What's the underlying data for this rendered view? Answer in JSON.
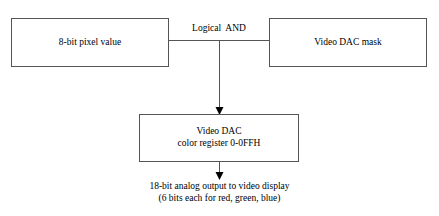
{
  "diagram": {
    "background_color": "#ffffff",
    "line_color": "#555555",
    "text_color": "#000000",
    "boxes": {
      "pixel_value": {
        "label": "8-bit pixel value"
      },
      "dac_mask": {
        "label": "Video DAC mask"
      },
      "video_dac": {
        "line1": "Video DAC",
        "line2": "color register 0-0FFH"
      }
    },
    "labels": {
      "logical_and": "Logical  AND"
    },
    "caption": {
      "line1": "18-bit analog output to video display",
      "line2": "(6 bits each for red, green, blue)"
    }
  }
}
